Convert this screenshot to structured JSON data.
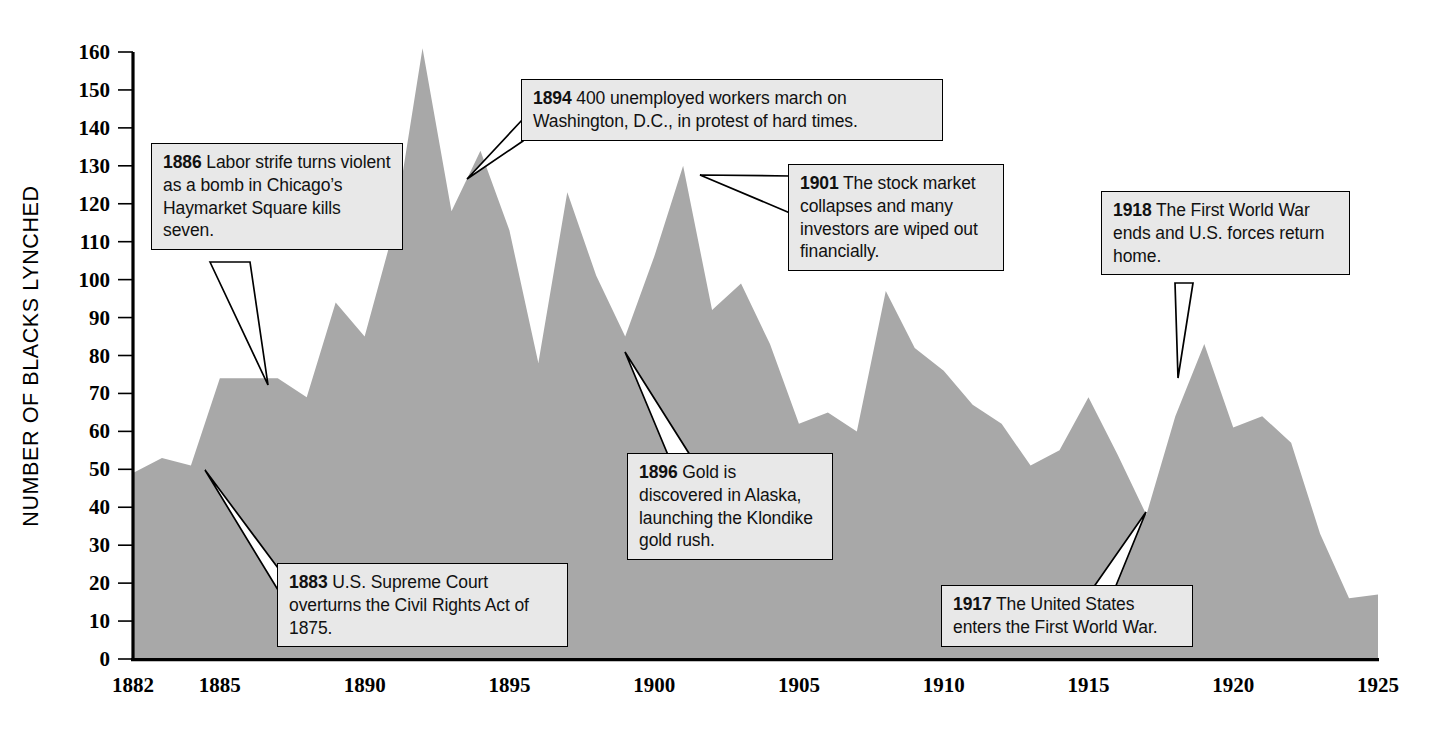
{
  "chart_data": {
    "type": "area",
    "title": "",
    "xlabel": "",
    "ylabel": "NUMBER OF BLACKS LYNCHED",
    "xlim": [
      1882,
      1925
    ],
    "ylim": [
      0,
      160
    ],
    "grid": false,
    "legend": "none",
    "fill_color": "#a8a8a8",
    "x_ticks": [
      "1882",
      "1885",
      "1890",
      "1895",
      "1900",
      "1905",
      "1910",
      "1915",
      "1920",
      "1925"
    ],
    "y_ticks": [
      "0",
      "10",
      "20",
      "30",
      "40",
      "50",
      "60",
      "70",
      "80",
      "90",
      "100",
      "110",
      "120",
      "130",
      "140",
      "150",
      "160"
    ],
    "x": [
      1882,
      1883,
      1884,
      1885,
      1886,
      1887,
      1888,
      1889,
      1890,
      1891,
      1892,
      1893,
      1894,
      1895,
      1896,
      1897,
      1898,
      1899,
      1900,
      1901,
      1902,
      1903,
      1904,
      1905,
      1906,
      1907,
      1908,
      1909,
      1910,
      1911,
      1912,
      1913,
      1914,
      1915,
      1916,
      1917,
      1918,
      1919,
      1920,
      1921,
      1922,
      1923,
      1924,
      1925
    ],
    "values": [
      49,
      53,
      51,
      74,
      74,
      74,
      69,
      94,
      85,
      113,
      161,
      118,
      134,
      113,
      78,
      123,
      101,
      85,
      106,
      130,
      92,
      99,
      83,
      62,
      65,
      60,
      97,
      82,
      76,
      67,
      62,
      51,
      55,
      69,
      54,
      38,
      64,
      83,
      61,
      64,
      57,
      33,
      16,
      17
    ],
    "annotations": [
      {
        "year": "1883",
        "text": "U.S. Supreme Court overturns the Civil Rights Act of 1875."
      },
      {
        "year": "1886",
        "text": "Labor strife turns violent as a bomb in Chicago's Haymarket Square kills seven."
      },
      {
        "year": "1894",
        "text": "400 unemployed workers march on Washington, D.C., in protest of hard times."
      },
      {
        "year": "1896",
        "text": "Gold is discovered in Alaska, launching the Klondike gold rush."
      },
      {
        "year": "1901",
        "text": "The stock market collapses and many investors are wiped out financially."
      },
      {
        "year": "1917",
        "text": "The United States enters the First World War."
      },
      {
        "year": "1918",
        "text": "The First World War ends and U.S. forces return home."
      }
    ]
  },
  "callouts": {
    "c1886": {
      "year": "1886",
      "line1": "Labor strife turns",
      "line2": "violent as a bomb in",
      "line3": "Chicago’s Haymarket",
      "line4": "Square kills seven.",
      "rest": " Labor strife turns violent as a bomb in Chicago’s Haymarket Square kills seven."
    },
    "c1894": {
      "year": "1894",
      "rest": " 400 unemployed workers march on Washington, D.C., in protest of hard times."
    },
    "c1901": {
      "year": "1901",
      "rest": " The stock market collapses and many investors are wiped out financially."
    },
    "c1918": {
      "year": "1918",
      "rest": " The First World War ends and U.S. forces return home."
    },
    "c1896": {
      "year": "1896",
      "rest": " Gold is discovered in Alaska, launching the Klondike gold rush."
    },
    "c1883": {
      "year": "1883",
      "rest": " U.S. Supreme Court overturns the Civil Rights Act of 1875."
    },
    "c1917": {
      "year": "1917",
      "rest": " The United States enters the First World War."
    }
  },
  "axis": {
    "y_title": "NUMBER OF BLACKS LYNCHED"
  }
}
